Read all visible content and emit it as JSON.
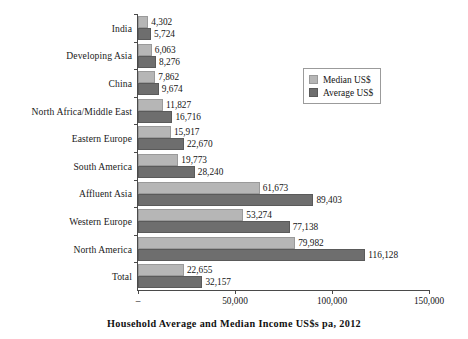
{
  "chart_data": {
    "type": "bar",
    "orientation": "horizontal",
    "title": "",
    "xlabel": "Household Average and Median Income US$s pa, 2012",
    "ylabel": "",
    "xlim": [
      0,
      150000
    ],
    "xticks": [
      "–",
      "50,000",
      "100,000",
      "150,000"
    ],
    "xtick_values": [
      0,
      50000,
      100000,
      150000
    ],
    "grid": false,
    "legend_position": "top-right",
    "categories": [
      "India",
      "Developing Asia",
      "China",
      "North Africa/Middle East",
      "Eastern Europe",
      "South America",
      "Affluent Asia",
      "Western Europe",
      "North America",
      "Total"
    ],
    "series": [
      {
        "name": "Median US$",
        "color": "#b6b6b6",
        "values": [
          4302,
          6063,
          7862,
          11827,
          15917,
          19773,
          61673,
          53274,
          79982,
          22655
        ],
        "labels": [
          "4,302",
          "6,063",
          "7,862",
          "11,827",
          "15,917",
          "19,773",
          "61,673",
          "53,274",
          "79,982",
          "22,655"
        ]
      },
      {
        "name": "Average US$",
        "color": "#6e6e6e",
        "values": [
          5724,
          8276,
          9674,
          16716,
          22670,
          28240,
          89403,
          77138,
          116128,
          32157
        ],
        "labels": [
          "5,724",
          "8,276",
          "9,674",
          "16,716",
          "22,670",
          "28,240",
          "89,403",
          "77,138",
          "116,128",
          "32,157"
        ]
      }
    ]
  },
  "legend": {
    "items": [
      {
        "label": "Median US$",
        "swatch": "median"
      },
      {
        "label": "Average US$",
        "swatch": "average"
      }
    ]
  }
}
